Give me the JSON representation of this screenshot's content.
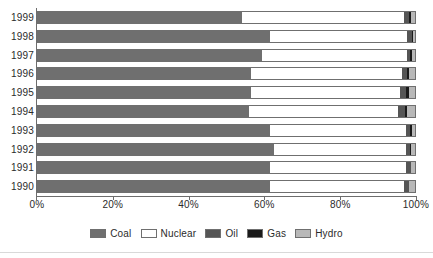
{
  "chart_data": {
    "type": "bar",
    "orientation": "horizontal",
    "stacked": true,
    "normalized_percent": true,
    "title": "",
    "xlabel": "",
    "ylabel": "",
    "xlim": [
      0,
      100
    ],
    "grid": false,
    "legend_position": "bottom",
    "categories": [
      "1999",
      "1998",
      "1997",
      "1996",
      "1995",
      "1994",
      "1993",
      "1992",
      "1991",
      "1990"
    ],
    "x_tick_labels": [
      "0%",
      "20%",
      "40%",
      "60%",
      "80%",
      "100%"
    ],
    "x_tick_values": [
      0,
      20,
      40,
      60,
      80,
      100
    ],
    "series": [
      {
        "name": "Coal",
        "color": "#6f6f6f",
        "values": [
          54.0,
          61.5,
          59.5,
          56.5,
          56.5,
          56.0,
          61.5,
          62.5,
          61.5,
          61.5
        ]
      },
      {
        "name": "Nuclear",
        "color": "#ffffff",
        "values": [
          43.0,
          36.5,
          38.5,
          40.0,
          39.5,
          39.5,
          36.0,
          35.0,
          36.0,
          35.5
        ]
      },
      {
        "name": "Oil",
        "color": "#555555",
        "values": [
          1.3,
          1.3,
          0.8,
          1.3,
          1.6,
          1.8,
          1.3,
          1.3,
          1.3,
          1.3
        ]
      },
      {
        "name": "Gas",
        "color": "#1a1a1a",
        "values": [
          0.7,
          0.2,
          0.4,
          0.7,
          0.8,
          0.7,
          0.4,
          0.2,
          0.2,
          0.2
        ]
      },
      {
        "name": "Hydro",
        "color": "#b8b8b8",
        "values": [
          1.0,
          0.5,
          0.8,
          1.5,
          1.6,
          2.0,
          0.8,
          1.0,
          1.0,
          1.5
        ]
      }
    ],
    "legend": [
      "Coal",
      "Nuclear",
      "Oil",
      "Gas",
      "Hydro"
    ]
  },
  "legend": {
    "items": [
      {
        "label": "Coal"
      },
      {
        "label": "Nuclear"
      },
      {
        "label": "Oil"
      },
      {
        "label": "Gas"
      },
      {
        "label": "Hydro"
      }
    ]
  },
  "title_sliver": ""
}
